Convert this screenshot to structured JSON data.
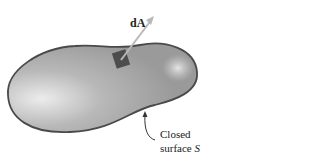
{
  "figure": {
    "vector_label_prefix": "d",
    "vector_label_bold": "A",
    "caption_line1": "Closed",
    "caption_line2_text": "surface ",
    "caption_line2_symbol": "S"
  },
  "colors": {
    "surface_fill": "#a9a9a9",
    "surface_highlight": "#e4e4e4",
    "outline": "#4a4a4a",
    "patch": "#4d4d4d",
    "arrow": "#b8b8b8"
  }
}
